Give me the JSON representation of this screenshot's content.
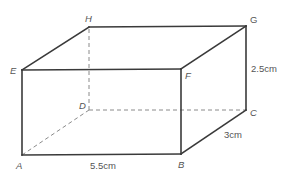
{
  "diagram": {
    "colors": {
      "edge": "#3a3a3a",
      "hidden_edge": "#8a8a8a",
      "label": "#555555",
      "background": "#ffffff"
    },
    "vertices": {
      "A": {
        "label": "A",
        "x": 22,
        "y": 155
      },
      "B": {
        "label": "B",
        "x": 181,
        "y": 154
      },
      "C": {
        "label": "C",
        "x": 246,
        "y": 110
      },
      "D": {
        "label": "D",
        "x": 89,
        "y": 110
      },
      "E": {
        "label": "E",
        "x": 22,
        "y": 70
      },
      "F": {
        "label": "F",
        "x": 181,
        "y": 69
      },
      "G": {
        "label": "G",
        "x": 246,
        "y": 26
      },
      "H": {
        "label": "H",
        "x": 89,
        "y": 27
      }
    },
    "visible_edges": [
      "AB",
      "BC",
      "CG",
      "GH",
      "HE",
      "EA",
      "EF",
      "FG",
      "FB"
    ],
    "hidden_edges": [
      "AD",
      "DC",
      "DH"
    ],
    "dimensions": {
      "length": {
        "label": "5.5cm",
        "edge": "AB"
      },
      "width": {
        "label": "3cm",
        "edge": "BC"
      },
      "height": {
        "label": "2.5cm",
        "edge": "CG"
      }
    }
  }
}
